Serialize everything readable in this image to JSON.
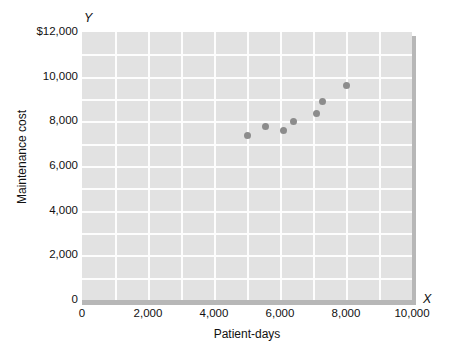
{
  "figure": {
    "axis_letter_y": "Y",
    "axis_letter_x": "X"
  },
  "chart_data": {
    "type": "scatter",
    "title": "",
    "xlabel": "Patient-days",
    "ylabel": "Maintenance cost",
    "xlim": [
      0,
      10000
    ],
    "ylim": [
      0,
      12000
    ],
    "grid": true,
    "legend": "none",
    "x_ticks": [
      0,
      2000,
      4000,
      6000,
      8000,
      10000
    ],
    "x_tick_labels": [
      "0",
      "2,000",
      "4,000",
      "6,000",
      "8,000",
      "10,000"
    ],
    "y_ticks": [
      0,
      2000,
      4000,
      6000,
      8000,
      10000,
      12000
    ],
    "y_tick_labels": [
      "0",
      "2,000",
      "4,000",
      "6,000",
      "8,000",
      "10,000",
      "$12,000"
    ],
    "x_gridline_step": 1000,
    "y_gridline_step": 1000,
    "point_color": "#8c8c8c",
    "plot_background_color": "#e2e2e2",
    "gridline_color": "#fdfdfd",
    "shadow_color": "#b7b7b7",
    "points": [
      {
        "x": 5000,
        "y": 7350
      },
      {
        "x": 5550,
        "y": 7750
      },
      {
        "x": 6100,
        "y": 7570
      },
      {
        "x": 6400,
        "y": 8000
      },
      {
        "x": 7100,
        "y": 8370
      },
      {
        "x": 7300,
        "y": 8900
      },
      {
        "x": 8000,
        "y": 9620
      }
    ]
  }
}
